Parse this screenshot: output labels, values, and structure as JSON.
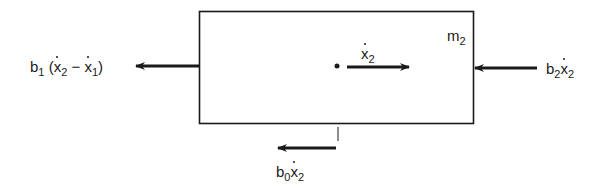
{
  "diagram": {
    "mass_label": {
      "base": "m",
      "sub": "2"
    },
    "velocity_label": {
      "base": "x",
      "sub": "2",
      "dotted": true
    },
    "forces": {
      "left": {
        "coef": "b",
        "coef_sub": "1",
        "expr_open": "(",
        "v1": "x",
        "v1_sub": "2",
        "minus": "−",
        "v2": "x",
        "v2_sub": "1",
        "expr_close": ")",
        "direction": "left"
      },
      "right": {
        "coef": "b",
        "coef_sub": "2",
        "v": "x",
        "v_sub": "2",
        "direction": "left"
      },
      "bottom": {
        "coef": "b",
        "coef_sub": "0",
        "v": "x",
        "v_sub": "2",
        "direction": "left"
      }
    },
    "stroke_color": "#1a1a1a"
  }
}
